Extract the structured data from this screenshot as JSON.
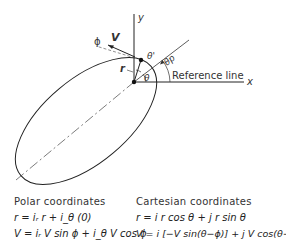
{
  "diagram": {
    "labels": {
      "y_axis": "y",
      "x_axis": "x",
      "velocity": "V",
      "flight_path_angle": "ϕ",
      "radius": "r",
      "theta": "θ",
      "theta_prime": "θ'",
      "theta_p": "θp",
      "reference_line": "Reference line"
    }
  },
  "equations": {
    "polar": {
      "heading": "Polar coordinates",
      "r_eq": "r = iᵣ r + i_θ (0)",
      "v_eq": "V = iᵣ V sin ϕ + i_θ V cos ϕ"
    },
    "cartesian": {
      "heading": "Cartesian coordinates",
      "r_eq": "r = i r cos θ + j r sin θ",
      "v_eq": "V = i [−V sin(θ−ϕ)] + j V cos(θ−ϕ)"
    }
  }
}
